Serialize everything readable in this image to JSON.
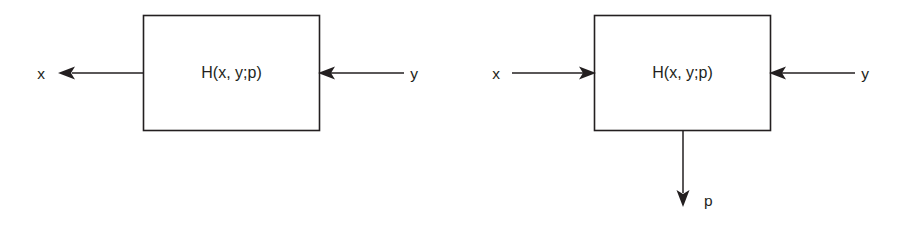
{
  "figure": {
    "background_color": "#ffffff",
    "line_color": "#231f20",
    "text_color": "#231f20"
  },
  "diagrams": [
    {
      "id": "left-diagram",
      "block_label": "H(x, y;p)",
      "ports": [
        {
          "name": "x",
          "label": "x",
          "direction": "output",
          "side": "left",
          "arrow": "points-left"
        },
        {
          "name": "y",
          "label": "y",
          "direction": "input",
          "side": "right",
          "arrow": "points-left"
        }
      ]
    },
    {
      "id": "right-diagram",
      "block_label": "H(x, y;p)",
      "ports": [
        {
          "name": "x",
          "label": "x",
          "direction": "input",
          "side": "left",
          "arrow": "points-right"
        },
        {
          "name": "y",
          "label": "y",
          "direction": "input",
          "side": "right",
          "arrow": "points-left"
        },
        {
          "name": "p",
          "label": "p",
          "direction": "output",
          "side": "bottom",
          "arrow": "points-down"
        }
      ]
    }
  ],
  "labels": {
    "left_block": "H(x, y;p)",
    "left_x": "x",
    "left_y": "y",
    "right_block": "H(x, y;p)",
    "right_x": "x",
    "right_y": "y",
    "right_p": "p"
  }
}
